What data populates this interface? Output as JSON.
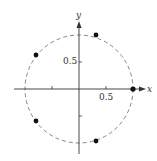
{
  "diagram": {
    "title": "",
    "axes": {
      "x_label": "x",
      "y_label": "y",
      "x_tick_label": "0.5",
      "y_tick_label": "0.5"
    },
    "circle": {
      "type": "unit circle",
      "radius": 1,
      "style": "dashed"
    },
    "points": [
      {
        "x": 1.0,
        "y": 0.0
      },
      {
        "x": 0.309,
        "y": 0.951
      },
      {
        "x": -0.809,
        "y": 0.588
      },
      {
        "x": -0.809,
        "y": -0.588
      },
      {
        "x": 0.309,
        "y": -0.951
      }
    ],
    "colors": {
      "axis": "#333333",
      "circle": "#666666",
      "point": "#111111"
    }
  }
}
